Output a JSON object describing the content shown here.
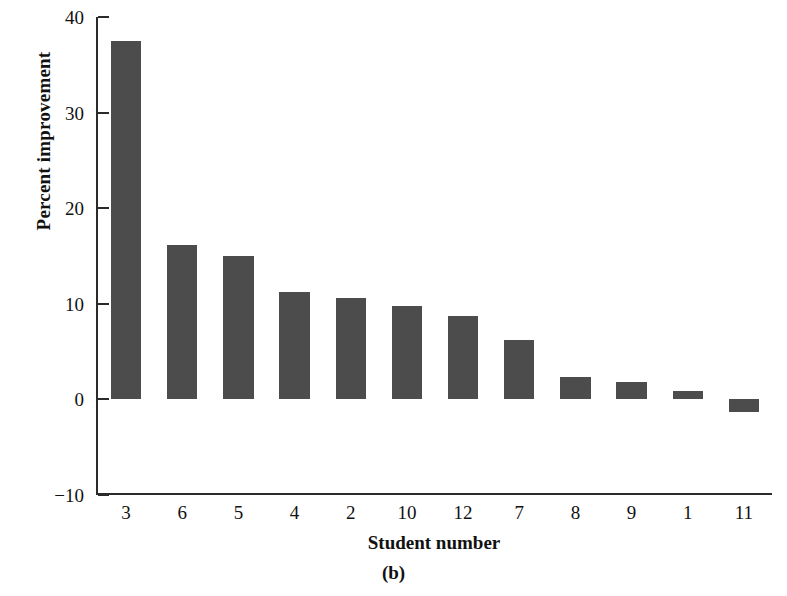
{
  "chart_data": {
    "type": "bar",
    "title": "",
    "subtitle": "",
    "caption": "(b)",
    "xlabel": "Student number",
    "ylabel": "Percent improvement",
    "categories": [
      "3",
      "6",
      "5",
      "4",
      "2",
      "10",
      "12",
      "7",
      "8",
      "9",
      "1",
      "11"
    ],
    "values": [
      37.5,
      16.1,
      15.0,
      11.2,
      10.6,
      9.8,
      8.7,
      6.2,
      2.3,
      1.8,
      0.9,
      -1.3
    ],
    "series": [
      {
        "name": "Percent improvement",
        "values": [
          37.5,
          16.1,
          15.0,
          11.2,
          10.6,
          9.8,
          8.7,
          6.2,
          2.3,
          1.8,
          0.9,
          -1.3
        ]
      }
    ],
    "ylim": [
      -10,
      40
    ],
    "yticks": [
      "40",
      "30",
      "20",
      "10",
      "0",
      "−10"
    ],
    "ytick_values": [
      40,
      30,
      20,
      10,
      0,
      -10
    ],
    "xlim_note": "categorical",
    "grid": false,
    "legend": null,
    "bar_color": "#4c4c4c",
    "axis_color": "#2b2b2b",
    "background_color": "#ffffff"
  }
}
